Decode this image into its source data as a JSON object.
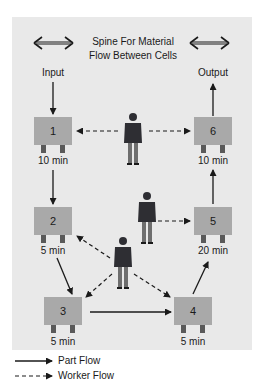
{
  "title": {
    "line1": "Spine For Material",
    "line2": "Flow Between Cells"
  },
  "labels": {
    "input": "Input",
    "output": "Output"
  },
  "cells": [
    {
      "id": "1",
      "time": "10 min"
    },
    {
      "id": "2",
      "time": "5 min"
    },
    {
      "id": "3",
      "time": "5 min"
    },
    {
      "id": "4",
      "time": "5 min"
    },
    {
      "id": "5",
      "time": "20 min"
    },
    {
      "id": "6",
      "time": "10 min"
    }
  ],
  "legend": {
    "part_flow": "Part Flow",
    "worker_flow": "Worker Flow"
  },
  "colors": {
    "panel": "#e9e9e9",
    "cell": "#a9a9a9",
    "arrow": "#1a1a1a",
    "worker_jacket": "#2e2e33",
    "worker_pants": "#6e6e6e"
  },
  "icons": {
    "spine_arrow": "double-headed-arrow",
    "worker": "person-icon"
  }
}
